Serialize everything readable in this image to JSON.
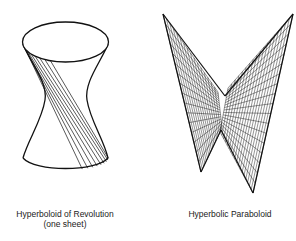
{
  "figures": [
    {
      "name": "hyperboloid",
      "caption_line1": "Hyperboloid of Revolution",
      "caption_line2": "(one sheet)"
    },
    {
      "name": "paraboloid",
      "caption_line1": "Hyperbolic Paraboloid"
    }
  ],
  "colors": {
    "ink": "#111111",
    "background": "#ffffff"
  }
}
